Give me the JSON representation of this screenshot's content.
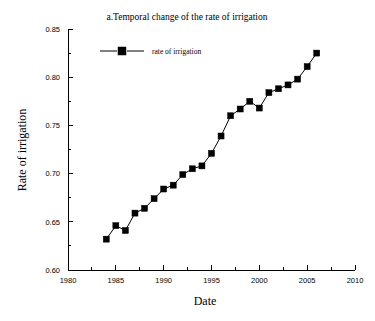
{
  "chart_data": {
    "type": "line",
    "title": "a.Temporal change of the rate of irrigation",
    "xlabel": "Date",
    "ylabel": "Rate of irrigation",
    "xlim": [
      1980,
      2010
    ],
    "ylim": [
      0.6,
      0.85
    ],
    "xticks": [
      1980,
      1985,
      1990,
      1995,
      2000,
      2005,
      2010
    ],
    "xticklabels": [
      "1980",
      "1985",
      "1990",
      "1995",
      "2000",
      "2005",
      "2010"
    ],
    "yticks": [
      0.6,
      0.65,
      0.7,
      0.75,
      0.8,
      0.85
    ],
    "yticklabels": [
      "0.60",
      "0.65",
      "0.70",
      "0.75",
      "0.80",
      "0.85"
    ],
    "x_minor_interval": 2.5,
    "y_minor_interval": 0.025,
    "grid": false,
    "legend": {
      "position": "top-left-inside",
      "entries": [
        {
          "name": "rate of irrigation",
          "marker": "filled-square",
          "color": "#000000"
        }
      ]
    },
    "series": [
      {
        "name": "rate of irrigation",
        "color": "#000000",
        "marker": "filled-square",
        "x": [
          1984,
          1985,
          1986,
          1987,
          1988,
          1989,
          1990,
          1991,
          1992,
          1993,
          1994,
          1995,
          1996,
          1997,
          1998,
          1999,
          2000,
          2001,
          2002,
          2003,
          2004,
          2005,
          2006
        ],
        "values": [
          0.632,
          0.646,
          0.641,
          0.659,
          0.664,
          0.674,
          0.684,
          0.688,
          0.699,
          0.705,
          0.708,
          0.721,
          0.739,
          0.76,
          0.767,
          0.775,
          0.768,
          0.784,
          0.788,
          0.792,
          0.798,
          0.811,
          0.825
        ]
      }
    ]
  }
}
